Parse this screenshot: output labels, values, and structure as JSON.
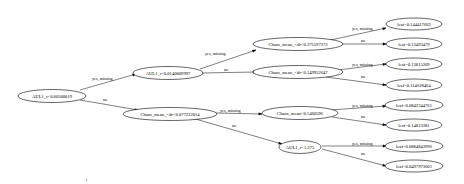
{
  "tree": {
    "nodes": {
      "n0": {
        "label": "AUL1_r<0.00500019"
      },
      "n1": {
        "label": "AUL1_r<0.0140009997"
      },
      "n2": {
        "label": "Chaos_mean_<dr<0.077232014"
      },
      "n3": {
        "label": "Chaos_mean_<dr<0.375597273"
      },
      "n4": {
        "label": "Chaos_mean_<dr<0.149952647"
      },
      "n5": {
        "label": "Chaos_mean<0.1460596"
      },
      "n6": {
        "label": "AUL1_r<1.375"
      },
      "l0": {
        "label": "leaf=0.144417662"
      },
      "l1": {
        "label": "leaf=0.13493479"
      },
      "l2": {
        "label": "leaf=0.13815209"
      },
      "l3": {
        "label": "leaf=0.114628464"
      },
      "l4": {
        "label": "leaf=0.0842344761"
      },
      "l5": {
        "label": "leaf=0.14823381"
      },
      "l6": {
        "label": "leaf=0.0884843996"
      },
      "l7": {
        "label": "leaf=0.0497973601"
      }
    },
    "edge_labels": {
      "yes": "yes, missing",
      "no": "no"
    },
    "footnote": "i"
  }
}
